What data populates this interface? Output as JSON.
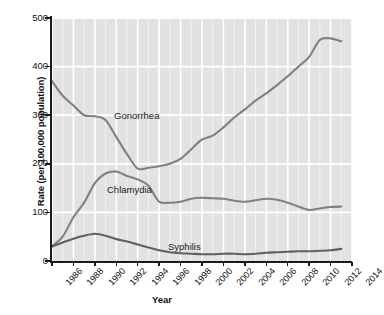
{
  "chart_data": {
    "type": "line",
    "title": "",
    "xlabel": "Year",
    "ylabel": "Rate (per 100,000 population)",
    "xlim": [
      1986,
      2014
    ],
    "ylim": [
      0,
      500
    ],
    "yticks": [
      0,
      100,
      200,
      300,
      400,
      500
    ],
    "xticks": [
      1986,
      1988,
      1990,
      1992,
      1994,
      1996,
      1998,
      2000,
      2002,
      2004,
      2006,
      2008,
      2010,
      2012,
      2014
    ],
    "grid": true,
    "grid_color": "#ffffff",
    "plot_background": "#e2e2e2",
    "legend_position": "inline-annotations",
    "x": [
      1986,
      1987,
      1988,
      1989,
      1990,
      1991,
      1992,
      1993,
      1994,
      1995,
      1996,
      1997,
      1998,
      1999,
      2000,
      2001,
      2002,
      2003,
      2004,
      2005,
      2006,
      2007,
      2008,
      2009,
      2010,
      2011,
      2012,
      2013
    ],
    "series": [
      {
        "name": "Gonorrhea",
        "color": "#808080",
        "values": [
          370,
          340,
          320,
          300,
          298,
          290,
          255,
          220,
          190,
          192,
          195,
          200,
          210,
          230,
          250,
          258,
          275,
          295,
          312,
          330,
          345,
          362,
          380,
          400,
          420,
          455,
          458,
          452
        ]
      },
      {
        "name": "Chlamydia",
        "color": "#808080",
        "values": [
          30,
          50,
          90,
          120,
          160,
          180,
          184,
          175,
          168,
          155,
          122,
          120,
          122,
          128,
          130,
          129,
          128,
          124,
          122,
          125,
          128,
          126,
          120,
          112,
          105,
          108,
          111,
          112
        ]
      },
      {
        "name": "Syphilis",
        "color": "#606060",
        "values": [
          30,
          38,
          46,
          52,
          56,
          52,
          45,
          40,
          34,
          28,
          22,
          18,
          16,
          15,
          14,
          14,
          15,
          15,
          14,
          15,
          17,
          18,
          19,
          20,
          20,
          21,
          22,
          25
        ]
      }
    ],
    "annotations": [
      {
        "text": "Gonorrhea",
        "near_x": 1988,
        "near_y": 345
      },
      {
        "text": "Chlamydia",
        "near_x": 1986,
        "near_y": 195
      },
      {
        "text": "Syphilis",
        "near_x": 1993,
        "near_y": 75
      }
    ]
  },
  "axis": {
    "ylabel": "Rate (per 100,000 population)",
    "xlabel": "Year",
    "ytick_labels": [
      "500",
      "400",
      "300",
      "200",
      "100",
      "0"
    ],
    "xtick_labels": [
      "1986",
      "1988",
      "1990",
      "1992",
      "1994",
      "1996",
      "1998",
      "2000",
      "2002",
      "2004",
      "2006",
      "2008",
      "2010",
      "2012",
      "2014"
    ]
  }
}
